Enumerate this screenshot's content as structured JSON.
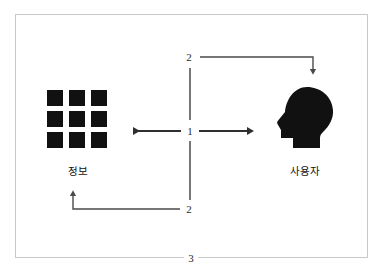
{
  "diagram": {
    "frame": {
      "border_color": "#c9c9c9",
      "background": "#ffffff"
    },
    "nodes": [
      {
        "id": "information",
        "label": "정보",
        "icon": "grid-squares-icon",
        "squares": 9,
        "color": "#111111",
        "position": "left"
      },
      {
        "id": "user",
        "label": "사용자",
        "icon": "head-silhouette-icon",
        "color": "#111111",
        "position": "right"
      }
    ],
    "flow_labels": {
      "center": "1",
      "top": "2",
      "bottom": "2",
      "frame_bottom": "3"
    },
    "connectors": [
      {
        "id": "center-left-arrow",
        "from": "center",
        "to": "information",
        "direction": "left",
        "label": "1"
      },
      {
        "id": "center-right-arrow",
        "from": "center",
        "to": "user",
        "direction": "right",
        "label": "1"
      },
      {
        "id": "top-arrow",
        "from": "center-top",
        "to": "user",
        "direction": "down",
        "label": "2"
      },
      {
        "id": "bottom-arrow",
        "from": "center-bottom",
        "to": "information",
        "direction": "up",
        "label": "2"
      }
    ],
    "divider": {
      "id": "vertical-divider",
      "style": "broken-line",
      "color": "#555555"
    },
    "colors": {
      "ink": "#111111",
      "line": "#4a4a4a",
      "frame": "#c9c9c9"
    }
  }
}
